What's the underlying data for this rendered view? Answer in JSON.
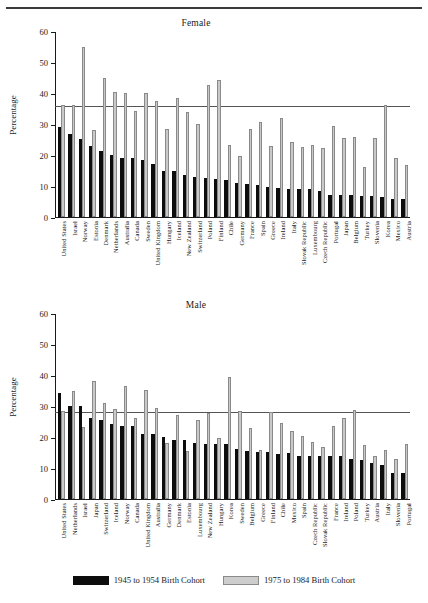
{
  "figure": {
    "top_rule": true,
    "legend": [
      {
        "key": "old",
        "label": "1945 to 1954 Birth Cohort",
        "color": "#0d0d0d"
      },
      {
        "key": "young",
        "label": "1975 to 1984 Birth Cohort",
        "color": "#cdcdcd"
      }
    ]
  },
  "chart_data": [
    {
      "type": "bar",
      "title": "Female",
      "xlabel": "",
      "ylabel": "Percentage",
      "ylim": [
        0,
        60
      ],
      "yticks": [
        0,
        10,
        20,
        30,
        40,
        50,
        60
      ],
      "grid": false,
      "legend_position": "bottom",
      "reference_line": 36.0,
      "categories": [
        "United States",
        "Israel",
        "Norway",
        "Estonia",
        "Denmark",
        "Netherlands",
        "Australia",
        "Canada",
        "Sweden",
        "United Kingdom",
        "Hungary",
        "Iceland",
        "New Zealand",
        "Switzerland",
        "Poland",
        "Finland",
        "Chile",
        "Germany",
        "France",
        "Spain",
        "Greece",
        "Ireland",
        "Italy",
        "Slovak Republic",
        "Luxembourg",
        "Czech Republic",
        "Portugal",
        "Japan",
        "Belgium",
        "Turkey",
        "Slovenia",
        "Korea",
        "Mexico",
        "Austria"
      ],
      "series": [
        {
          "name": "1945 to 1954 Birth Cohort",
          "color": "#0d0d0d",
          "values": [
            29.1,
            26.7,
            25.1,
            22.8,
            21.2,
            20.1,
            19.1,
            19.0,
            18.4,
            17.0,
            15.0,
            14.9,
            13.4,
            12.9,
            12.5,
            12.3,
            12.1,
            11.1,
            10.5,
            10.4,
            9.6,
            9.4,
            9.1,
            9.1,
            8.9,
            8.4,
            7.2,
            7.2,
            7.2,
            6.9,
            6.9,
            6.4,
            5.8,
            5.8
          ]
        },
        {
          "name": "1975 to 1984 Birth Cohort",
          "color": "#cdcdcd",
          "values": [
            36.2,
            36.0,
            54.8,
            28.1,
            45.0,
            40.3,
            40.1,
            34.2,
            40.0,
            37.4,
            28.4,
            38.4,
            34.0,
            30.0,
            42.6,
            44.3,
            23.2,
            19.8,
            28.5,
            30.6,
            22.9,
            32.0,
            24.1,
            22.5,
            23.2,
            22.3,
            29.2,
            25.5,
            25.9,
            16.0,
            25.5,
            36.2,
            19.0,
            16.7
          ]
        }
      ]
    },
    {
      "type": "bar",
      "title": "Male",
      "xlabel": "",
      "ylabel": "Percentage",
      "ylim": [
        0,
        60
      ],
      "yticks": [
        0,
        10,
        20,
        30,
        40,
        50,
        60
      ],
      "grid": false,
      "legend_position": "bottom",
      "reference_line": 28.5,
      "categories": [
        "United States",
        "Netherlands",
        "Israel",
        "Japan",
        "Switzerland",
        "Iceland",
        "Norway",
        "Canada",
        "United Kingdom",
        "Australia",
        "Germany",
        "Denmark",
        "Estonia",
        "Luxembourg",
        "New Zealand",
        "Hungary",
        "Korea",
        "Sweden",
        "Belgium",
        "Greece",
        "Finland",
        "Chile",
        "Mexico",
        "Spain",
        "Czech Republic",
        "Slovak Republic",
        "France",
        "Ireland",
        "Poland",
        "Turkey",
        "Austria",
        "Italy",
        "Slovenia",
        "Portugal"
      ],
      "series": [
        {
          "name": "1945 to 1954 Birth Cohort",
          "color": "#0d0d0d",
          "values": [
            34.3,
            30.0,
            29.9,
            26.2,
            25.4,
            24.1,
            23.5,
            23.4,
            21.1,
            20.9,
            20.1,
            19.1,
            18.9,
            18.1,
            17.6,
            17.8,
            17.8,
            16.0,
            15.6,
            15.1,
            15.2,
            14.6,
            14.8,
            13.9,
            13.8,
            13.9,
            13.9,
            13.8,
            12.9,
            12.6,
            11.5,
            11.1,
            8.4,
            8.4
          ]
        },
        {
          "name": "1975 to 1984 Birth Cohort",
          "color": "#cdcdcd",
          "values": [
            28.3,
            34.8,
            23.2,
            38.0,
            31.1,
            28.9,
            36.5,
            26.1,
            35.1,
            29.3,
            18.2,
            27.2,
            15.5,
            25.6,
            27.9,
            19.8,
            39.4,
            28.5,
            22.8,
            15.7,
            28.2,
            24.5,
            21.9,
            20.3,
            18.3,
            16.9,
            23.4,
            26.1,
            28.6,
            17.4,
            14.0,
            15.7,
            12.8,
            17.9
          ]
        }
      ]
    }
  ]
}
